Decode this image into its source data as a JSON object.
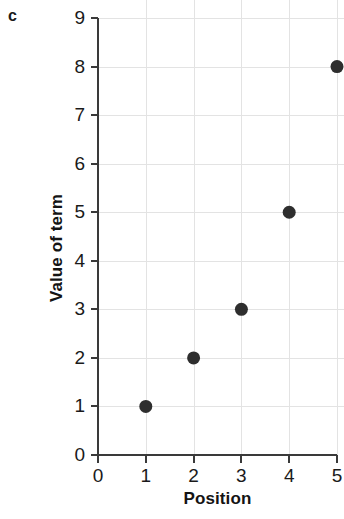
{
  "panel": {
    "label": "c"
  },
  "chart_data": {
    "type": "scatter",
    "title": "",
    "subtitle": "",
    "xlabel": "Position",
    "ylabel": "Value of term",
    "x": [
      1,
      2,
      3,
      4,
      5
    ],
    "values": [
      1,
      2,
      3,
      5,
      8
    ],
    "points": [
      {
        "x": 1,
        "y": 1
      },
      {
        "x": 2,
        "y": 2
      },
      {
        "x": 3,
        "y": 3
      },
      {
        "x": 4,
        "y": 5
      },
      {
        "x": 5,
        "y": 8
      }
    ],
    "xlim": [
      0,
      5
    ],
    "ylim": [
      0,
      9
    ],
    "xticks": [
      0,
      1,
      2,
      3,
      4,
      5
    ],
    "yticks": [
      0,
      1,
      2,
      3,
      4,
      5,
      6,
      7,
      8,
      9
    ],
    "xtick_labels": [
      "0",
      "1",
      "2",
      "3",
      "4",
      "5"
    ],
    "ytick_labels": [
      "0",
      "1",
      "2",
      "3",
      "4",
      "5",
      "6",
      "7",
      "8",
      "9"
    ],
    "grid": true,
    "legend": false,
    "marker_color": "#2e2e2e",
    "grid_color": "#e3e3e3",
    "axis_color": "#3a3a3a",
    "marker_radius": 6.5
  }
}
